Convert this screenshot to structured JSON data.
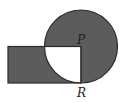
{
  "diagram": {
    "type": "geometry",
    "colors": {
      "stroke": "#2a2a2a",
      "shade": "#5c5c5c",
      "background": "#ffffff"
    },
    "circle": {
      "center": [
        81,
        46.5
      ],
      "radius": 36.5
    },
    "rectangle": {
      "x": 8,
      "y": 46.5,
      "width": 73,
      "height": 36.5
    },
    "segments": [
      {
        "name": "PR",
        "from": [
          81,
          46.5
        ],
        "to": [
          81,
          83
        ]
      },
      {
        "name": "rect-top",
        "from": [
          8,
          46.5
        ],
        "to": [
          81,
          46.5
        ]
      }
    ],
    "points": [
      {
        "id": "P",
        "label": "P",
        "x": 81,
        "y": 46.5,
        "label_x": 77,
        "label_y": 43.5
      },
      {
        "id": "R",
        "label": "R",
        "x": 81,
        "y": 83,
        "label_x": 77,
        "label_y": 97
      }
    ]
  }
}
